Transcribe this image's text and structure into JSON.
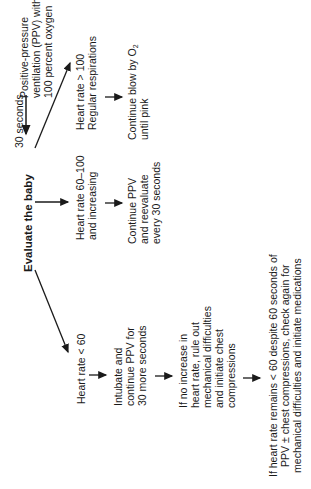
{
  "diagram": {
    "title_node": "Evaluate the baby",
    "ppv_node": {
      "lines": [
        "Positive-pressure",
        "ventilation (PPV) with",
        "100 percent oxygen"
      ]
    },
    "loop_label": "30 seconds",
    "branch_high": {
      "condition": [
        "Heart rate > 100",
        "Regular respirations"
      ],
      "action": [
        "Continue blow by O",
        "until pink"
      ],
      "action_subscript": "2"
    },
    "branch_mid": {
      "condition": [
        "Heart rate 60–100",
        "and increasing"
      ],
      "action": [
        "Continue PPV",
        "and reevaluate",
        "every 30 seconds"
      ]
    },
    "branch_low": {
      "condition": [
        "Heart rate < 60"
      ],
      "step1": [
        "Intubate and",
        "continue PPV for",
        "30 more seconds"
      ],
      "step2": [
        "If no increase in",
        "heart rate, rule out",
        "mechanical difficulties",
        "and initiate chest",
        "compressions"
      ],
      "step3": [
        "If heart rate remains < 60 despite 60 seconds of",
        "PPV ± chest compressions, check again for",
        "mechanical difficulties and initiate medications"
      ]
    }
  }
}
